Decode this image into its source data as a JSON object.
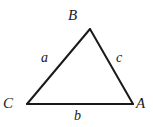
{
  "figure": {
    "kind": "geometry-diagram",
    "shape": "triangle",
    "width": 153,
    "height": 127,
    "background_color": "#ffffff",
    "stroke_color": "#1a1a1a",
    "stroke_width": 2,
    "text_color": "#1a1a1a",
    "vertices": [
      {
        "key": "B",
        "label": "B",
        "x": 90,
        "y": 29,
        "label_position": "above"
      },
      {
        "key": "C",
        "label": "C",
        "x": 27,
        "y": 104,
        "label_position": "left-below"
      },
      {
        "key": "A",
        "label": "A",
        "x": 133,
        "y": 104,
        "label_position": "right-below"
      }
    ],
    "sides": [
      {
        "key": "a",
        "label": "a",
        "from": "C",
        "to": "B",
        "label_position": "inside-left"
      },
      {
        "key": "c",
        "label": "c",
        "from": "B",
        "to": "A",
        "label_position": "inside-right"
      },
      {
        "key": "b",
        "label": "b",
        "from": "C",
        "to": "A",
        "label_position": "below"
      }
    ]
  }
}
